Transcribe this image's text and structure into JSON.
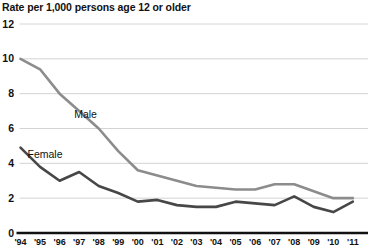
{
  "chart_data": {
    "type": "line",
    "title": "Rate per 1,000 persons age 12 or older",
    "xlabel": "",
    "ylabel": "",
    "ylim": [
      0,
      12
    ],
    "yticks": [
      0,
      2,
      4,
      6,
      8,
      10,
      12
    ],
    "ytick_labels": [
      "0",
      "2",
      "4",
      "6",
      "8",
      "10",
      "12"
    ],
    "grid": true,
    "grid_axis": "y",
    "legend_position": "inline-labels",
    "categories": [
      "1994",
      "1995",
      "1996",
      "1997",
      "1998",
      "1999",
      "2000",
      "2001",
      "2002",
      "2003",
      "2004",
      "2005",
      "2006",
      "2007",
      "2008",
      "2009",
      "2010",
      "2011"
    ],
    "xtick_labels": [
      "'94",
      "'95",
      "'96",
      "'97",
      "'98",
      "'99",
      "'00",
      "'01",
      "'02",
      "'03",
      "'04",
      "'05",
      "'06",
      "'07",
      "'08",
      "'09",
      "'10",
      "'11"
    ],
    "series": [
      {
        "name": "Male",
        "color": "#8c8c8c",
        "label": "Male",
        "values": [
          10.0,
          9.4,
          8.0,
          7.0,
          6.0,
          4.7,
          3.6,
          3.3,
          3.0,
          2.7,
          2.6,
          2.5,
          2.5,
          2.8,
          2.8,
          2.4,
          2.0,
          2.0
        ]
      },
      {
        "name": "Female",
        "color": "#474747",
        "label": "Female",
        "values": [
          4.9,
          3.8,
          3.0,
          3.5,
          2.7,
          2.3,
          1.8,
          1.9,
          1.6,
          1.5,
          1.5,
          1.8,
          1.7,
          1.6,
          2.1,
          1.5,
          1.2,
          1.8
        ]
      }
    ],
    "colors": {
      "male_line": "#8c8c8c",
      "female_line": "#474747",
      "gridline": "#cfcfcf",
      "axis": "#111111",
      "text": "#111111",
      "background": "#ffffff"
    }
  }
}
